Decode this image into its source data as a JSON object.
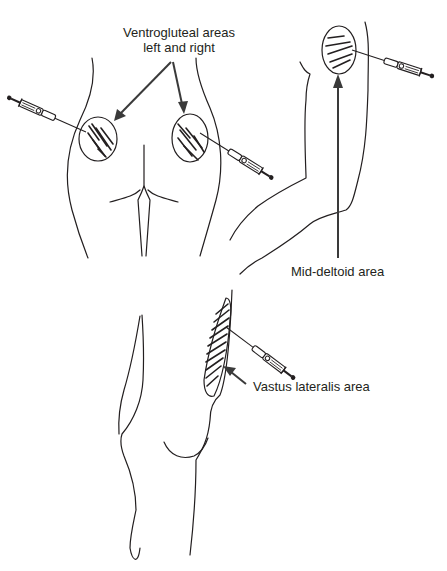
{
  "figure": {
    "colors": {
      "line": "#231f20",
      "arrow": "#3a3a3a",
      "background": "#ffffff"
    },
    "panels": [
      {
        "id": "ventrogluteal",
        "view": "posterior hips / buttocks",
        "sites": [
          "left ventrogluteal",
          "right ventrogluteal"
        ],
        "syringes": 2
      },
      {
        "id": "deltoid",
        "view": "upper arm",
        "sites": [
          "mid-deltoid"
        ],
        "syringes": 1
      },
      {
        "id": "vastus-lateralis",
        "view": "lateral thigh",
        "sites": [
          "vastus lateralis"
        ],
        "syringes": 1
      }
    ]
  },
  "labels": {
    "ventrogluteal_line1": "Ventrogluteal areas",
    "ventrogluteal_line2": "left and right",
    "deltoid": "Mid-deltoid area",
    "vastus": "Vastus lateralis area"
  },
  "icons": {
    "syringe": "syringe-icon",
    "injection_site": "hatched-ellipse",
    "pointer": "arrow"
  }
}
